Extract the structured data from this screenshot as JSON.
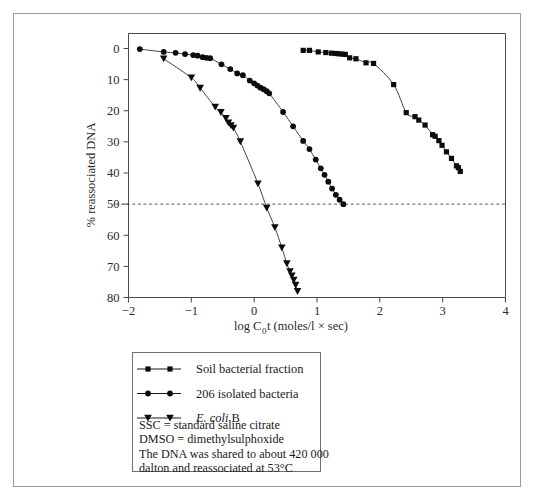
{
  "figure": {
    "y_axis": {
      "title": "% reassociated DNA",
      "ticks": [
        "0",
        "10",
        "20",
        "30",
        "40",
        "50",
        "60",
        "70",
        "80"
      ]
    },
    "x_axis": {
      "title_prefix": "log C",
      "title_sub": "0",
      "title_suffix": "t (moles/l × sec)",
      "ticks": [
        "−2",
        "−1",
        "0",
        "1",
        "2",
        "3",
        "4"
      ]
    },
    "legend": {
      "entries": [
        {
          "label": "Soil bacterial fraction",
          "marker": "square",
          "italic": false
        },
        {
          "label": "206 isolated bacteria",
          "marker": "circle",
          "italic": false
        },
        {
          "label": "E. coli B",
          "marker": "triangle-down",
          "italic": true
        }
      ],
      "notes": [
        "SSC = standard saline citrate",
        "DMSO = dimethylsulphoxide",
        "The DNA was shared to about 420 000",
        "dalton and reassociated at 53°C"
      ]
    },
    "colors": {
      "marker": "#0c0c0c",
      "curve": "#444444",
      "frame": "#4a4a4a",
      "reference_line": "#5b5b5b",
      "background": "#ffffff"
    }
  },
  "chart_data": {
    "type": "scatter",
    "title": "",
    "xlabel": "log C0t (moles/l × sec)",
    "ylabel": "% reassociated DNA",
    "xlim": [
      -2,
      4
    ],
    "ylim": [
      0,
      80
    ],
    "y_inverted": true,
    "grid": false,
    "legend_position": "below-plot",
    "reference_lines": [
      {
        "axis": "y",
        "value": 50,
        "style": "dashed",
        "label": "50% reassociation"
      }
    ],
    "series": [
      {
        "name": "Soil bacterial fraction",
        "marker": "square",
        "points": [
          [
            0.78,
            0.6
          ],
          [
            0.88,
            0.6
          ],
          [
            1.02,
            1.1
          ],
          [
            1.14,
            1.3
          ],
          [
            1.23,
            1.5
          ],
          [
            1.3,
            1.6
          ],
          [
            1.35,
            1.7
          ],
          [
            1.4,
            1.8
          ],
          [
            1.45,
            1.9
          ],
          [
            1.52,
            3.0
          ],
          [
            1.62,
            3.3
          ],
          [
            1.78,
            4.6
          ],
          [
            1.9,
            4.8
          ],
          [
            2.22,
            11.6
          ],
          [
            2.42,
            20.6
          ],
          [
            2.56,
            21.9
          ],
          [
            2.62,
            23.0
          ],
          [
            2.72,
            24.6
          ],
          [
            2.84,
            27.7
          ],
          [
            2.88,
            28.2
          ],
          [
            2.94,
            29.6
          ],
          [
            2.99,
            31.1
          ],
          [
            3.06,
            33.2
          ],
          [
            3.14,
            35.3
          ],
          [
            3.22,
            37.7
          ],
          [
            3.25,
            38.3
          ],
          [
            3.28,
            39.5
          ]
        ]
      },
      {
        "name": "206 isolated bacteria",
        "marker": "circle",
        "points": [
          [
            -1.82,
            0.2
          ],
          [
            -1.44,
            1.1
          ],
          [
            -1.25,
            1.4
          ],
          [
            -1.1,
            1.8
          ],
          [
            -0.97,
            2.1
          ],
          [
            -0.9,
            2.3
          ],
          [
            -0.82,
            2.8
          ],
          [
            -0.76,
            3.0
          ],
          [
            -0.7,
            3.1
          ],
          [
            -0.52,
            5.1
          ],
          [
            -0.38,
            6.6
          ],
          [
            -0.27,
            8.0
          ],
          [
            -0.18,
            8.6
          ],
          [
            -0.07,
            10.3
          ],
          [
            0.0,
            11.2
          ],
          [
            0.05,
            11.9
          ],
          [
            0.1,
            12.6
          ],
          [
            0.15,
            13.1
          ],
          [
            0.2,
            13.7
          ],
          [
            0.24,
            14.4
          ],
          [
            0.46,
            20.4
          ],
          [
            0.62,
            25.0
          ],
          [
            0.78,
            29.7
          ],
          [
            0.88,
            32.3
          ],
          [
            0.98,
            35.7
          ],
          [
            1.06,
            38.5
          ],
          [
            1.12,
            40.6
          ],
          [
            1.18,
            42.8
          ],
          [
            1.24,
            45.0
          ],
          [
            1.3,
            47.0
          ],
          [
            1.36,
            48.6
          ],
          [
            1.42,
            50.0
          ]
        ]
      },
      {
        "name": "E. coli B",
        "marker": "triangle-down",
        "points": [
          [
            -1.44,
            3.3
          ],
          [
            -1.0,
            9.4
          ],
          [
            -0.86,
            12.7
          ],
          [
            -0.62,
            18.8
          ],
          [
            -0.53,
            20.5
          ],
          [
            -0.45,
            22.4
          ],
          [
            -0.41,
            23.8
          ],
          [
            -0.37,
            24.7
          ],
          [
            -0.33,
            25.5
          ],
          [
            -0.22,
            29.9
          ],
          [
            0.06,
            43.4
          ],
          [
            0.2,
            51.2
          ],
          [
            0.33,
            57.5
          ],
          [
            0.44,
            64.0
          ],
          [
            0.52,
            69.1
          ],
          [
            0.57,
            71.6
          ],
          [
            0.6,
            73.0
          ],
          [
            0.63,
            74.4
          ],
          [
            0.66,
            76.0
          ],
          [
            0.69,
            78.0
          ]
        ]
      }
    ]
  }
}
